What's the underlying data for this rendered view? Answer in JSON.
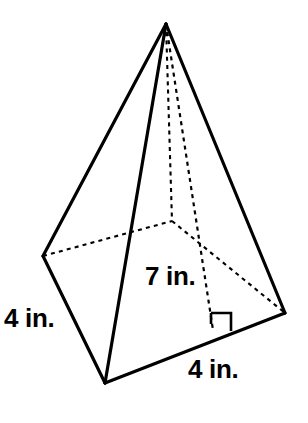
{
  "figure": {
    "kind": "rectangular-pyramid-net-diagram",
    "line_color": "#000000",
    "background_color": "#ffffff"
  },
  "labels": {
    "left_side": "4 in.",
    "height": "7 in.",
    "base_front": "4 in."
  },
  "geometry": {
    "vertices": {
      "apex": [
        166,
        24
      ],
      "base_left": [
        43,
        256
      ],
      "base_front": [
        105,
        383
      ],
      "base_right": [
        285,
        313
      ],
      "base_back_hidden": [
        172,
        221
      ],
      "altitude_foot": [
        213,
        330
      ]
    },
    "solid_edges": [
      [
        [
          166,
          24
        ],
        [
          43,
          256
        ]
      ],
      [
        [
          166,
          24
        ],
        [
          105,
          383
        ]
      ],
      [
        [
          166,
          24
        ],
        [
          285,
          313
        ]
      ],
      [
        [
          43,
          256
        ],
        [
          105,
          383
        ]
      ],
      [
        [
          105,
          383
        ],
        [
          285,
          313
        ]
      ]
    ],
    "hidden_edges": [
      [
        [
          43,
          256
        ],
        [
          172,
          221
        ]
      ],
      [
        [
          172,
          221
        ],
        [
          285,
          313
        ]
      ],
      [
        [
          166,
          24
        ],
        [
          172,
          221
        ]
      ]
    ],
    "altitude": [
      [
        166,
        24
      ],
      [
        213,
        330
      ]
    ],
    "right_angle_marker": true
  }
}
